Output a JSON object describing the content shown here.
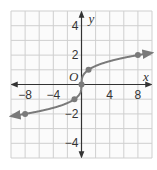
{
  "chart_data": {
    "type": "line",
    "title": "",
    "function": "y = cube root of x",
    "xlabel": "x",
    "ylabel": "y",
    "origin_label": "O",
    "xlim": [
      -10,
      10
    ],
    "ylim": [
      -5,
      5
    ],
    "grid": true,
    "grid_step_x": 2,
    "grid_step_y": 1,
    "x_ticks": [
      -8,
      -4,
      4,
      8
    ],
    "x_tick_labels": [
      "−8",
      "−4",
      "4",
      "8"
    ],
    "y_ticks": [
      4,
      2,
      -2,
      -4
    ],
    "y_tick_labels": [
      "4",
      "2",
      "−2",
      "−4"
    ],
    "series": [
      {
        "name": "cube root curve",
        "points": [
          [
            -8,
            -2
          ],
          [
            -1,
            -1
          ],
          [
            0,
            0
          ],
          [
            1,
            1
          ],
          [
            8,
            2
          ]
        ],
        "arrows_both_ends": true
      }
    ],
    "colors": {
      "curve": "#7a7a7a",
      "grid": "#cfcfcf",
      "axis": "#333333"
    }
  }
}
